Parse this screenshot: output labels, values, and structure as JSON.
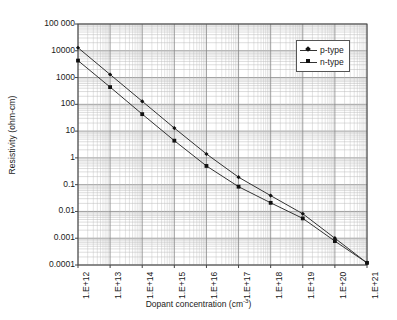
{
  "chart_data": {
    "type": "line",
    "title": "",
    "xlabel": "Dopant concentration (cm⁻³)",
    "xlabel_text": "Dopant concentration (cm",
    "xlabel_sup": "-3",
    "xlabel_tail": ")",
    "ylabel": "Resistivity (ohm-cm)",
    "xscale": "log",
    "yscale": "log",
    "xlim": [
      1000000000000.0,
      1e+21
    ],
    "ylim": [
      0.0001,
      100000
    ],
    "grid": true,
    "minor_grid": true,
    "legend_position": "top-right",
    "x_tick_labels": [
      "1.E+12",
      "1.E+13",
      "1.E+14",
      "1.E+15",
      "1.E+16",
      "1.E+17",
      "1.E+18",
      "1.E+19",
      "1.E+20",
      "1.E+21"
    ],
    "x": [
      1000000000000.0,
      10000000000000.0,
      100000000000000.0,
      1000000000000000.0,
      1e+16,
      1e+17,
      1e+18,
      1e+19,
      1e+20,
      1e+21
    ],
    "y_tick_labels": [
      "100 000",
      "10000",
      "1000",
      "100",
      "10",
      "1",
      "0.1",
      "0.01",
      "0.001",
      "0.0001"
    ],
    "y_ticks": [
      100000,
      10000,
      1000,
      100,
      10,
      1,
      0.1,
      0.01,
      0.001,
      0.0001
    ],
    "series": [
      {
        "name": "p-type",
        "marker": "diamond",
        "color": "#333333",
        "values": [
          13000,
          1300,
          130,
          13,
          1.4,
          0.19,
          0.039,
          0.0082,
          0.001,
          0.00012
        ]
      },
      {
        "name": "n-type",
        "marker": "square",
        "color": "#333333",
        "values": [
          4300,
          440,
          43,
          4.4,
          0.5,
          0.084,
          0.021,
          0.0055,
          0.00078,
          0.00012
        ]
      }
    ]
  },
  "legend": {
    "items": [
      {
        "label": "p-type",
        "marker": "diamond"
      },
      {
        "label": "n-type",
        "marker": "square"
      }
    ]
  },
  "colors": {
    "axis": "#444444",
    "grid_major": "#888888",
    "grid_minor": "#bbbbbb",
    "series": "#333333",
    "background": "#ffffff",
    "text": "#1a1a1a"
  }
}
